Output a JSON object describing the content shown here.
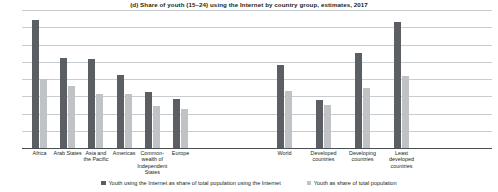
{
  "chart_data": {
    "type": "bar",
    "title": "(d) Share of youth (15–24) using the Internet by country group, estimates, 2017",
    "xlabel": "",
    "ylabel": "",
    "ylim": [
      0,
      40
    ],
    "yticks": [
      0,
      5,
      10,
      15,
      20,
      25,
      30,
      35,
      40
    ],
    "grid": true,
    "legend_position": "bottom",
    "categories": [
      "Africa",
      "Arab States",
      "Asia and\nthe Pacific",
      "Americas",
      "Common-\nwealth of\nIndependent\nStates",
      "Europe",
      "World",
      "Developed\ncountries",
      "Developing\ncountries",
      "Least\ndeveloped\ncountries"
    ],
    "series": [
      {
        "name": "Youth using the Internet as share of total population using the Internet",
        "color": "#5b5f63",
        "values": [
          37.0,
          26.2,
          25.9,
          21.2,
          16.2,
          14.3,
          24.0,
          14.0,
          27.5,
          36.5
        ]
      },
      {
        "name": "Youth as share of total population",
        "color": "#c0c3c6",
        "values": [
          20.0,
          18.0,
          15.6,
          15.6,
          12.2,
          11.3,
          16.5,
          12.5,
          17.5,
          21.0
        ]
      }
    ]
  },
  "legend": {
    "items": [
      {
        "label": "Youth using the Internet as share of total population using the Internet",
        "swatch": "dark"
      },
      {
        "label": "Youth as share of total population",
        "swatch": "light"
      }
    ]
  }
}
